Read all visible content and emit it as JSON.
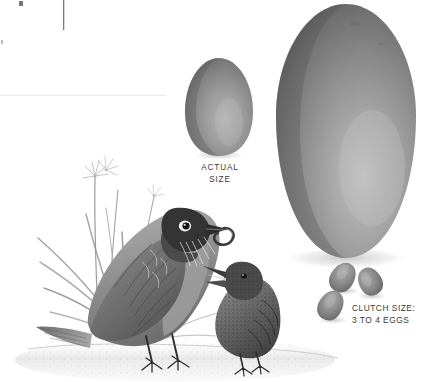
{
  "plate": {
    "kind": "natural-history-illustration",
    "subject": "American Robin adult feeding fledgling, with eggs",
    "background_color": "#ffffff"
  },
  "captions": {
    "actual_size": {
      "line1": "ACTUAL",
      "line2": "SIZE",
      "color": "#3b3b3b"
    },
    "clutch": {
      "line1": "CLUTCH SIZE:",
      "line2": "3 TO 4 EGGS",
      "color": "#3b3b3b"
    }
  },
  "eggs": {
    "actual_size_egg": {
      "label": "actual-size-egg",
      "highlight_color": "#b0b0b0",
      "mid_color": "#888888",
      "shadow_color": "#5e5e5e"
    },
    "enlarged_egg": {
      "label": "enlarged-egg",
      "highlight_color": "#bcbcbc",
      "mid_color": "#808080",
      "shadow_color": "#575757"
    },
    "clutch_eggs": {
      "count": 3,
      "highlight_color": "#a8a8a8",
      "mid_color": "#808080",
      "shadow_color": "#585858"
    }
  },
  "birds": {
    "adult": {
      "label": "adult-robin",
      "holding": "earthworm",
      "breast_color": "#9a9a9a",
      "head_color": "#3a3a3a"
    },
    "fledgling": {
      "label": "juvenile-robin",
      "beak_state": "open",
      "body_color": "#6e6e6e"
    }
  },
  "vegetation": {
    "label": "grass-and-flowers",
    "blade_color": "#9c9c9c",
    "flower_color": "#c9c9c9"
  },
  "ground": {
    "label": "ground-stipple",
    "color": "#cfcfcf"
  },
  "page_artifacts": {
    "rule_color": "#ededed",
    "tick_color": "#555555"
  }
}
